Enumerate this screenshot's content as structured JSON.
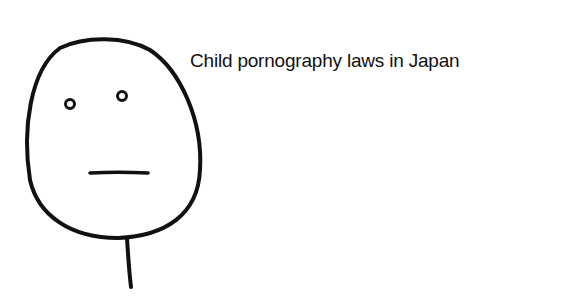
{
  "meme": {
    "caption": "Child pornography laws in Japan",
    "face": "poker-face",
    "ink_color": "#111111",
    "background_color": "#ffffff"
  }
}
